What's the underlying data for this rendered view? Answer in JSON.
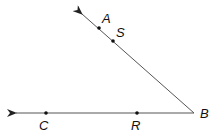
{
  "diagram": {
    "type": "angle",
    "vertex": {
      "label": "B",
      "x": 194,
      "y": 113
    },
    "rays": [
      {
        "name": "ray-BA",
        "end": {
          "x": 80,
          "y": 12
        },
        "points": [
          "S",
          "A"
        ]
      },
      {
        "name": "ray-BC",
        "end": {
          "x": 14,
          "y": 113
        },
        "points": [
          "R",
          "C"
        ]
      }
    ],
    "points": [
      {
        "label": "A",
        "x": 99,
        "y": 28,
        "label_x": 104,
        "label_y": 23
      },
      {
        "label": "S",
        "x": 113,
        "y": 41,
        "label_x": 118,
        "label_y": 37
      },
      {
        "label": "C",
        "x": 46,
        "y": 113,
        "label_x": 39,
        "label_y": 130
      },
      {
        "label": "R",
        "x": 137,
        "y": 113,
        "label_x": 131,
        "label_y": 130
      },
      {
        "label": "B",
        "x": 194,
        "y": 113,
        "label_x": 200,
        "label_y": 118
      }
    ],
    "colors": {
      "line": "#555555",
      "point": "#111111",
      "label": "#111111"
    }
  },
  "labels": {
    "A": "A",
    "S": "S",
    "C": "C",
    "R": "R",
    "B": "B"
  }
}
